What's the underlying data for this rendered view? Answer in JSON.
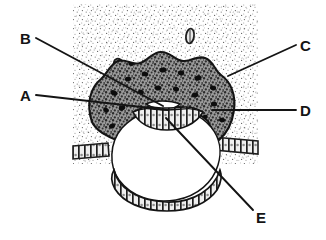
{
  "figure": {
    "background_color": "#ffffff",
    "stipple_color": "#6d6d6d",
    "ink_color": "#141414",
    "tissue_fill": "#5a5a5a",
    "cavity_fill": "#ffffff",
    "panel": {
      "x": 73,
      "y": 4,
      "width": 185,
      "height": 160
    }
  },
  "labels": [
    {
      "id": "A",
      "text": "A",
      "x": 20,
      "y": 88,
      "leader": {
        "x1": 36,
        "y1": 95,
        "x2": 168,
        "y2": 110
      }
    },
    {
      "id": "B",
      "text": "B",
      "x": 20,
      "y": 31,
      "leader": {
        "x1": 36,
        "y1": 38,
        "x2": 163,
        "y2": 106
      }
    },
    {
      "id": "C",
      "text": "C",
      "x": 300,
      "y": 38,
      "leader": {
        "x1": 296,
        "y1": 45,
        "x2": 228,
        "y2": 76
      }
    },
    {
      "id": "D",
      "text": "D",
      "x": 300,
      "y": 103,
      "leader": {
        "x1": 296,
        "y1": 110,
        "x2": 212,
        "y2": 110
      }
    },
    {
      "id": "E",
      "text": "E",
      "x": 256,
      "y": 210,
      "leader": {
        "x1": 253,
        "y1": 210,
        "x2": 166,
        "y2": 118
      }
    }
  ],
  "structures": {
    "endometrial_stroma": "stippled background panel",
    "syncytiotrophoblast": "dark mottled mass with lacunae",
    "lacunae": "black irregular spots within trophoblast",
    "blastocyst_cavity": "large white circular cavity",
    "amniotic_cavity": "small white lens-shaped cavity",
    "bilaminar_germ_disc": "banded cell row below amniotic cavity",
    "cytotrophoblast": "thin banded layer lining the cavity",
    "uterine_epithelium": "columnar cell row at left and right",
    "glands_vessels": "two small outlined ovals in stroma"
  },
  "glands": [
    {
      "cx": 190,
      "cy": 36,
      "rx": 4,
      "ry": 7,
      "rot": 8
    },
    {
      "cx": 119,
      "cy": 66,
      "rx": 5,
      "ry": 7,
      "rot": -18
    }
  ]
}
